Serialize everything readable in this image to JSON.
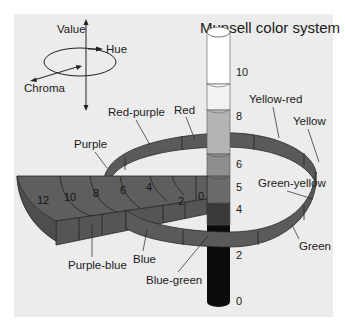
{
  "title": "Munsell color system",
  "legend": {
    "value": "Value",
    "hue": "Hue",
    "chroma": "Chroma"
  },
  "hues": {
    "red": "Red",
    "red_purple": "Red-purple",
    "purple": "Purple",
    "yellow_red": "Yellow-red",
    "yellow": "Yellow",
    "green_yellow": "Green-yellow",
    "green": "Green",
    "blue_green": "Blue-green",
    "blue": "Blue",
    "purple_blue": "Purple-blue"
  },
  "value_scale": [
    "10",
    "8",
    "6",
    "5",
    "4",
    "2",
    "0"
  ],
  "chroma_scale": [
    "12",
    "10",
    "8",
    "6",
    "4",
    "2",
    "0"
  ],
  "colors": {
    "panel": "#ececec",
    "ring": "#5a5a5a",
    "ring_edge": "#2a2a2a",
    "column_white": "#ffffff",
    "column_light": "#f4f4f4",
    "column_mid_light": "#b4b4b4",
    "column_mid": "#8e8e8e",
    "column_dark_mid": "#6a6a6a",
    "column_dark": "#3a3a3a",
    "column_black": "#0c0c0c"
  }
}
